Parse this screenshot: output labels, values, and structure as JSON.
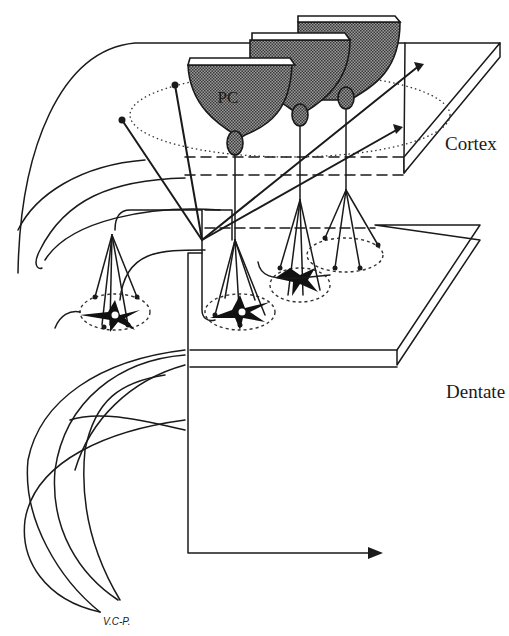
{
  "figure": {
    "type": "neuroanatomy schematic"
  },
  "labels": {
    "cortex": "Cortex",
    "dentate": "Dentate",
    "purkinje_cell": "PC",
    "signature": "V.C-P."
  },
  "layers": [
    {
      "name": "Cortex",
      "shape": "3D slab (upper plate)"
    },
    {
      "name": "Dentate",
      "shape": "3D slab (lower plate)"
    }
  ],
  "elements": {
    "purkinje_cells": 3,
    "cortical_collaterals_with_terminals": 4,
    "dentate_neurons": 3,
    "output_arrow": "horizontal arrow pointing right at bottom"
  },
  "colors": {
    "ink": "#1a1a1a",
    "background": "#ffffff",
    "pc_fill": "stippled gray"
  }
}
